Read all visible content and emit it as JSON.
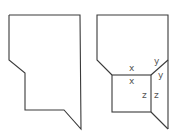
{
  "figures": [
    {
      "id": "unfolded-shape",
      "description": "Flat outline of a shape before folding"
    },
    {
      "id": "folded-shape",
      "description": "Outline with a folded square flap and matching edge labels",
      "labels": {
        "x_top": "x",
        "x_bottom": "x",
        "y_top": "y",
        "y_bottom": "y",
        "z_left": "z",
        "z_right": "z"
      }
    }
  ],
  "colors": {
    "line": "#3a3a3a",
    "label": "#555555",
    "background": "#ffffff"
  }
}
